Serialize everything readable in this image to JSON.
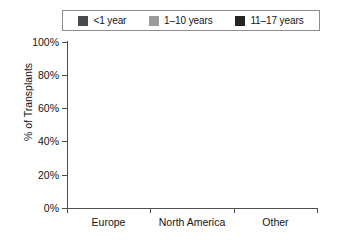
{
  "chart_data": {
    "type": "bar",
    "stacked": true,
    "stacked_mode": "percent",
    "title": "",
    "subtitle": "",
    "xlabel": "",
    "ylabel": "% of Transplants",
    "categories": [
      "Europe",
      "North America",
      "Other"
    ],
    "ylim": [
      0,
      100
    ],
    "yticks": [
      0,
      20,
      40,
      60,
      80,
      100
    ],
    "ytick_labels": [
      "0%",
      "20%",
      "40%",
      "60%",
      "80%",
      "100%"
    ],
    "grid": false,
    "legend_position": "top",
    "series": [
      {
        "name": "<1 year",
        "color": "#4a4a4a",
        "values": [
          8,
          29,
          7
        ]
      },
      {
        "name": "1–10 years",
        "color": "#9b9b9b",
        "values": [
          39,
          36,
          33
        ]
      },
      {
        "name": "11–17 years",
        "color": "#262626",
        "values": [
          53,
          35,
          60
        ]
      }
    ],
    "annotations": []
  },
  "legend": {
    "entries": [
      {
        "label": "<1 year",
        "color": "#4a4a4a"
      },
      {
        "label": "1–10 years",
        "color": "#9b9b9b"
      },
      {
        "label": "11–17 years",
        "color": "#262626"
      }
    ]
  },
  "axes": {
    "y_title": "% of Transplants",
    "y_ticks": [
      "100%",
      "80%",
      "60%",
      "40%",
      "20%",
      "0%"
    ],
    "x_ticks": [
      "Europe",
      "North America",
      "Other"
    ]
  },
  "colors": {
    "axis": "#4d4d4d",
    "text": "#141414",
    "background": "#ffffff",
    "legend_border": "#8e8e8e"
  }
}
